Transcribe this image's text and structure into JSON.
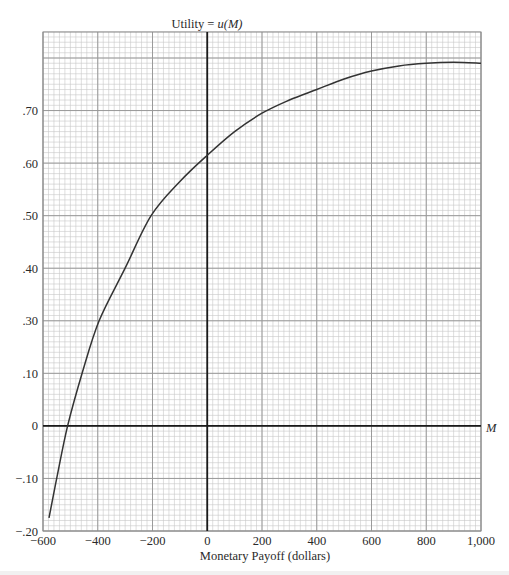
{
  "chart_data": {
    "type": "line",
    "title": "Utility = u(M)",
    "title_parts": {
      "prefix": "Utility = ",
      "func": "u(M)"
    },
    "xlabel": "Monetary Payoff (dollars)",
    "x_axis_end_label": "M",
    "ylabel": "Utility",
    "xlim": [
      -600,
      1000
    ],
    "ylim": [
      -0.2,
      0.85
    ],
    "grid": {
      "major": true,
      "minor": true,
      "minor_divisions": 10
    },
    "x_ticks": [
      {
        "value": -600,
        "label": "−600"
      },
      {
        "value": -400,
        "label": "−400"
      },
      {
        "value": -200,
        "label": "−200"
      },
      {
        "value": 0,
        "label": "0"
      },
      {
        "value": 200,
        "label": "200"
      },
      {
        "value": 400,
        "label": "400"
      },
      {
        "value": 600,
        "label": "600"
      },
      {
        "value": 800,
        "label": "800"
      },
      {
        "value": 1000,
        "label": "1,000"
      }
    ],
    "y_ticks": [
      {
        "value": 0.8,
        "label": ""
      },
      {
        "value": 0.7,
        "label": ".70"
      },
      {
        "value": 0.6,
        "label": ".60"
      },
      {
        "value": 0.5,
        "label": ".50"
      },
      {
        "value": 0.4,
        "label": ".40"
      },
      {
        "value": 0.3,
        "label": ".30"
      },
      {
        "value": 0.1,
        "label": ".10"
      },
      {
        "value": 0.0,
        "label": "0"
      },
      {
        "value": -0.1,
        "label": "−.10"
      },
      {
        "value": -0.2,
        "label": "−.20"
      }
    ],
    "series": [
      {
        "name": "u(M)",
        "x": [
          -578,
          -550,
          -510,
          -457,
          -395,
          -300,
          -205,
          -100,
          0,
          100,
          200,
          300,
          400,
          500,
          600,
          700,
          800,
          900,
          1000
        ],
        "y": [
          -0.175,
          -0.1,
          0.0,
          0.1,
          0.3,
          0.4,
          0.5,
          0.565,
          0.615,
          0.66,
          0.695,
          0.72,
          0.74,
          0.76,
          0.775,
          0.785,
          0.79,
          0.792,
          0.79
        ]
      }
    ],
    "annotations": [
      {
        "text": "M",
        "position": "right end of horizontal axis"
      }
    ],
    "colors": {
      "curve": "#333333",
      "axes": "#1a1a1a",
      "major_grid": "#9a9a9a",
      "minor_grid": "#c8c8c8",
      "frame": "#8a8a8a"
    }
  }
}
